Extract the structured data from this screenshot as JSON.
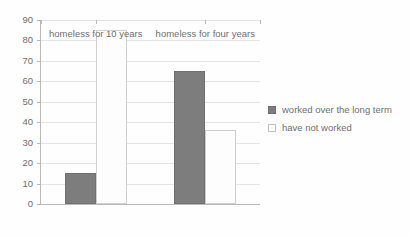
{
  "chart_data": {
    "type": "bar",
    "title": "",
    "subtitle": "",
    "xlabel": "",
    "ylabel": "",
    "categories": [
      "homeless for 10 years",
      "homeless for four years"
    ],
    "series": [
      {
        "name": "worked over the long term",
        "values": [
          15,
          65
        ],
        "color": "#7d7d7d"
      },
      {
        "name": "have not worked",
        "values": [
          85,
          36
        ],
        "color": "#ffffff"
      }
    ],
    "ylim": [
      0,
      90
    ],
    "ytick_values": [
      0,
      10,
      20,
      30,
      40,
      50,
      60,
      70,
      80,
      90
    ],
    "ytick_labels": [
      "0",
      "10",
      "20",
      "30",
      "40",
      "50",
      "60",
      "70",
      "80",
      "90"
    ],
    "grid": true,
    "legend_position": "right",
    "annotations": []
  },
  "legend": {
    "entries": [
      {
        "label": "worked over the long term",
        "swatch": "filled-dark-square"
      },
      {
        "label": "have not worked",
        "swatch": "outlined-white-square"
      }
    ]
  },
  "axis": {
    "y_axis_name": "value-axis",
    "x_axis_name": "category-axis"
  }
}
